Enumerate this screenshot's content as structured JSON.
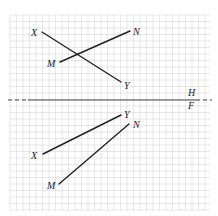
{
  "diagram": {
    "type": "descriptive-geometry-projection",
    "grid": {
      "x0": 10,
      "y0": 15,
      "x1": 210,
      "y1": 211,
      "spacing": 6.5,
      "color": "#d6d6d6"
    },
    "fold_line": {
      "y": 100,
      "x_start": 8,
      "x_end": 212,
      "dashed_left_end": 28,
      "dashed_right_start": 196,
      "color": "#444444",
      "upper_label": "H",
      "lower_label": "F"
    },
    "views": [
      {
        "name": "horizontal",
        "label": "H",
        "lines": [
          {
            "name": "XY",
            "from": {
              "label": "X",
              "x": 42,
              "y": 32
            },
            "to": {
              "label": "Y",
              "x": 121,
              "y": 82
            }
          },
          {
            "name": "MN",
            "from": {
              "label": "M",
              "x": 60,
              "y": 62
            },
            "to": {
              "label": "N",
              "x": 130,
              "y": 31
            }
          }
        ]
      },
      {
        "name": "frontal",
        "label": "F",
        "lines": [
          {
            "name": "XY",
            "from": {
              "label": "X",
              "x": 43,
              "y": 154
            },
            "to": {
              "label": "Y",
              "x": 121,
              "y": 115
            }
          },
          {
            "name": "MN",
            "from": {
              "label": "M",
              "x": 59,
              "y": 184
            },
            "to": {
              "label": "N",
              "x": 129,
              "y": 124
            }
          }
        ]
      }
    ],
    "labels": [
      {
        "text": "X",
        "x": 31,
        "y": 36
      },
      {
        "text": "N",
        "x": 133,
        "y": 35
      },
      {
        "text": "M",
        "x": 47,
        "y": 67
      },
      {
        "text": "Y",
        "x": 124,
        "y": 89
      },
      {
        "text": "H",
        "x": 188,
        "y": 96
      },
      {
        "text": "F",
        "x": 188,
        "y": 109
      },
      {
        "text": "Y",
        "x": 124,
        "y": 118
      },
      {
        "text": "N",
        "x": 133,
        "y": 128
      },
      {
        "text": "X",
        "x": 31,
        "y": 159
      },
      {
        "text": "M",
        "x": 47,
        "y": 189
      }
    ],
    "line_color": "#222222"
  }
}
